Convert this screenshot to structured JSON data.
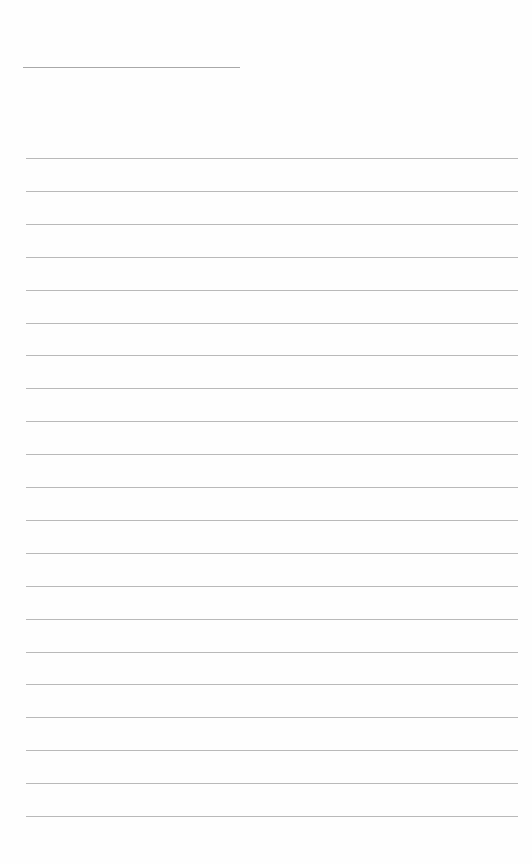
{
  "document": {
    "type": "blank lined page",
    "header_line": {
      "visible": true
    },
    "ruled_lines": {
      "count": 21,
      "color": "#b9b9b9"
    },
    "text": ""
  }
}
